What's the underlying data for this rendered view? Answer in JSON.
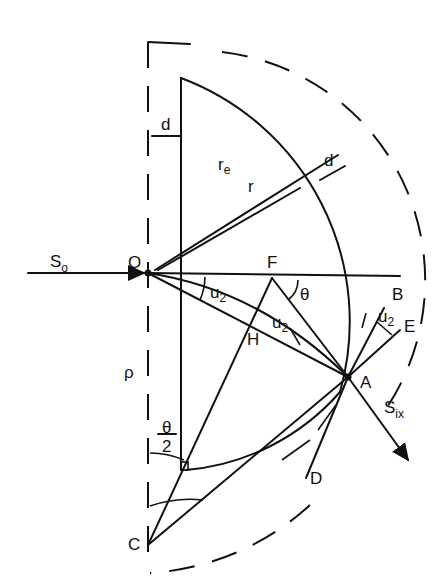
{
  "figure": {
    "type": "geometric optics diagram"
  },
  "labels": {
    "S0": "S",
    "S0_sub": "o",
    "O": "O",
    "F": "F",
    "H": "H",
    "A": "A",
    "B": "B",
    "C": "C",
    "D": "D",
    "E": "E",
    "Six": "S",
    "Six_sub": "ix",
    "rho": "ρ",
    "d_top": "d",
    "d_right": "d",
    "re": "r",
    "re_sub": "e",
    "r": "r",
    "theta": "θ",
    "theta_half_num": "θ",
    "theta_half_den": "2",
    "u2_a": "u",
    "u2_a_sub": "2",
    "u2_b": "u",
    "u2_b_sub": "2",
    "u2_c": "u",
    "u2_c_sub": "2"
  },
  "colors": {
    "ink": "#111111",
    "background": "#ffffff"
  }
}
